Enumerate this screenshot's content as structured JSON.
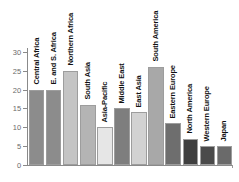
{
  "chart_data": {
    "type": "bar",
    "title": "",
    "subtitle": "",
    "xlabel": "",
    "ylabel": "",
    "ylim": [
      0,
      31
    ],
    "yticks": [
      0,
      5,
      10,
      15,
      20,
      25,
      30
    ],
    "ytick_labels": [
      "0",
      "5",
      "10",
      "15",
      "20",
      "25",
      "30"
    ],
    "grid": false,
    "legend": null,
    "categories": [
      "Central Africa",
      "E. and S. Africa",
      "Northern Africa",
      "South Asia",
      "Asia-Pacific",
      "Middle East",
      "East Asia",
      "South America",
      "Eastern Europe",
      "North America",
      "Western Europe",
      "Japan"
    ],
    "values": [
      20,
      20,
      25,
      16,
      10,
      15,
      14,
      26,
      11,
      7,
      5,
      5
    ],
    "bar_colors": [
      "#8c8c8c",
      "#8c8c8c",
      "#c4c4c4",
      "#b4b4b4",
      "#e6e6e6",
      "#7e7e7e",
      "#d2d2d2",
      "#a8a8a8",
      "#6e6e6e",
      "#3f3f3f",
      "#4a4a4a",
      "#6a6a6a"
    ],
    "axis_color": "#8a8a8a",
    "tick_label_color": "#6b6b6b",
    "bar_label_color": "#111111",
    "bar_edge_color": "#9d9d9d",
    "background": "#ffffff"
  }
}
